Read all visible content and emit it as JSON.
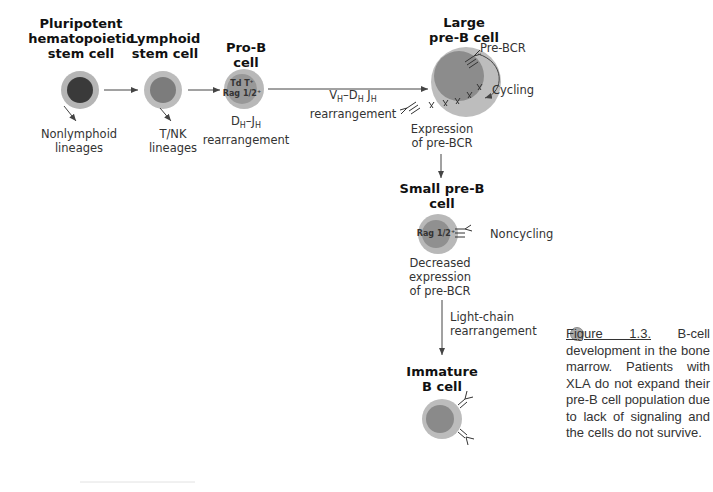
{
  "stages": {
    "pluripotent": {
      "title_lines": [
        "Pluripotent",
        "hematopoietic",
        "stem cell"
      ],
      "branch_label_lines": [
        "Nonlymphoid",
        "lineages"
      ]
    },
    "lymphoid": {
      "title_lines": [
        "Lymphoid",
        "stem cell"
      ],
      "branch_label_lines": [
        "T/NK",
        "lineages"
      ]
    },
    "pro_b": {
      "title": "Pro-B cell",
      "markers": [
        "Td T⁺",
        "Rag 1/2⁺"
      ],
      "rearrangement_seg1": "D",
      "rearrangement_sub1": "H",
      "rearrangement_seg2": "–J",
      "rearrangement_sub2": "H",
      "rearrangement_word": "rearrangement"
    },
    "vdj_step": {
      "v": "V",
      "v_sub": "H",
      "d": "–D",
      "d_sub": "H",
      "j": " J",
      "j_sub": "H",
      "word": "rearrangement"
    },
    "large_pre_b": {
      "title_lines": [
        "Large",
        "pre-B cell"
      ],
      "receptor_label": "Pre-BCR",
      "cycle_label": "Cycling",
      "note_lines": [
        "Expression",
        "of pre-BCR"
      ]
    },
    "small_pre_b": {
      "title_lines": [
        "Small pre-B",
        "cell"
      ],
      "marker": "Rag 1/2⁺",
      "state_label": "Noncycling",
      "note_lines": [
        "Decreased",
        "expression",
        "of pre-BCR"
      ]
    },
    "light_chain_step": {
      "lines": [
        "Light-chain",
        "rearrangement"
      ]
    },
    "immature_b": {
      "title_lines": [
        "Immature",
        "B cell"
      ]
    }
  },
  "caption": {
    "figure_ref": "Figure 1.3.",
    "text": " B-cell development in the bone marrow. Patients with XLA do not expand their pre-B cell population due to lack of signaling and the cells do not survive."
  },
  "colors": {
    "outer_cell": "#b8b8b8",
    "inner_dark": "#3a3a3a",
    "inner_mid": "#7a7a7a",
    "inner_light": "#9a9a9a",
    "arrow": "#444444"
  }
}
